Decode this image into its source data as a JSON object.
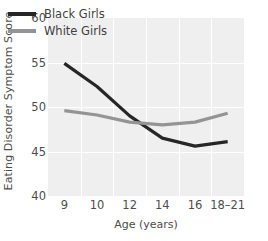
{
  "chart_data": {
    "type": "line",
    "title": "",
    "xlabel": "Age (years)",
    "ylabel": "Eating Disorder Symptom Score",
    "categories": [
      "9",
      "10",
      "12",
      "14",
      "16",
      "18–21"
    ],
    "series": [
      {
        "name": "Black Girls",
        "color": "#262626",
        "values": [
          54.9,
          52.3,
          49.0,
          46.5,
          45.6,
          46.1
        ]
      },
      {
        "name": "White Girls",
        "color": "#949494",
        "values": [
          49.6,
          49.1,
          48.3,
          48.0,
          48.3,
          49.3
        ]
      }
    ],
    "ylim": [
      40,
      60
    ],
    "yticks": [
      40,
      45,
      50,
      55,
      60
    ],
    "ytick_labels": [
      "40",
      "45",
      "50",
      "55",
      "60"
    ],
    "grid": true,
    "grid_color": "#ffffff",
    "plot_background": "#efefef",
    "legend_position": "top-left"
  },
  "legend": {
    "entries": [
      {
        "label": "Black Girls",
        "color": "#262626"
      },
      {
        "label": "White Girls",
        "color": "#949494"
      }
    ]
  },
  "axes": {
    "y_title": "Eating Disorder Symptom Score",
    "x_title": "Age (years)",
    "y_labels": [
      "60",
      "55",
      "50",
      "45",
      "40"
    ],
    "x_labels": [
      "9",
      "10",
      "12",
      "14",
      "16",
      "18–21"
    ]
  }
}
